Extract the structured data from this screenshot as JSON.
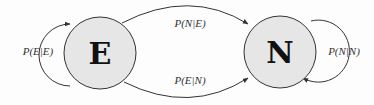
{
  "diagram": {
    "type": "markov-chain",
    "colors": {
      "state_fill": "#e6e6e6",
      "stroke": "#333333",
      "background": "#fdfdfd"
    },
    "states": [
      {
        "id": "E",
        "label": "E"
      },
      {
        "id": "N",
        "label": "N"
      }
    ],
    "transitions": [
      {
        "from": "E",
        "to": "E",
        "label": "P(E|E)"
      },
      {
        "from": "E",
        "to": "N",
        "label": "P(N|E)"
      },
      {
        "from": "N",
        "to": "E",
        "label": "P(E|N)"
      },
      {
        "from": "N",
        "to": "N",
        "label": "P(N|N)"
      }
    ]
  }
}
